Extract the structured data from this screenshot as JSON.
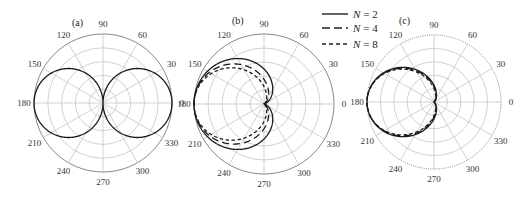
{
  "figure": {
    "panels": [
      "(a)",
      "(b)",
      "(c)"
    ],
    "legend": [
      {
        "label": "N = 2",
        "symbol": "N",
        "value": "= 2",
        "style": "solid"
      },
      {
        "label": "N = 4",
        "symbol": "N",
        "value": "= 4",
        "style": "long-dash"
      },
      {
        "label": "N = 8",
        "symbol": "N",
        "value": "= 8",
        "style": "short-dash"
      }
    ]
  },
  "chart_data": [
    {
      "type": "polar",
      "title": "(a)",
      "angle_ticks": [
        0,
        30,
        60,
        90,
        120,
        150,
        180,
        210,
        240,
        270,
        300,
        330
      ],
      "radial_rings": 5,
      "rlim": [
        0,
        1
      ],
      "grid": true,
      "series": [
        {
          "name": "pattern",
          "style": "solid",
          "function": "|cos(theta)|",
          "description": "figure-eight dipole pattern, max 1 at 0 and 180 deg, null at 90 and 270 deg"
        }
      ]
    },
    {
      "type": "polar",
      "title": "(b)",
      "angle_ticks": [
        0,
        30,
        60,
        90,
        120,
        150,
        180,
        210,
        240,
        270,
        300,
        330
      ],
      "radial_rings": 5,
      "rlim": [
        0,
        1
      ],
      "grid": true,
      "series": [
        {
          "name": "N = 2",
          "style": "solid",
          "description": "broad lobe toward 180 deg, half-power ~ +/-60 deg",
          "exponent": 1
        },
        {
          "name": "N = 4",
          "style": "long-dash",
          "description": "narrower lobe toward 180 deg",
          "exponent": 2
        },
        {
          "name": "N = 8",
          "style": "short-dash",
          "description": "narrowest lobe toward 180 deg",
          "exponent": 3
        }
      ]
    },
    {
      "type": "polar",
      "title": "(c)",
      "angle_ticks": [
        0,
        30,
        60,
        90,
        120,
        150,
        180,
        210,
        240,
        270,
        300,
        330
      ],
      "radial_rings": 5,
      "rlim": [
        0,
        1
      ],
      "grid": true,
      "outer_ring_style": "dotted",
      "series": [
        {
          "name": "N = 2",
          "style": "solid",
          "description": "teardrop lobe toward 180 deg, nearly identical for all N",
          "exponent": 2.0
        },
        {
          "name": "N = 4",
          "style": "long-dash",
          "exponent": 2.15
        },
        {
          "name": "N = 8",
          "style": "short-dash",
          "exponent": 2.3
        }
      ]
    }
  ]
}
